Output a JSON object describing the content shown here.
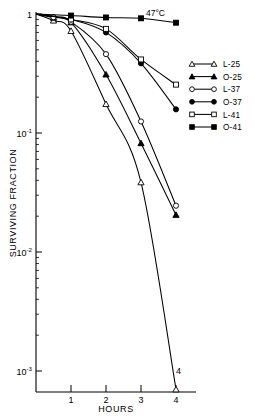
{
  "chart_data": {
    "type": "line",
    "title": "",
    "annotation": "47°C",
    "xlabel": "HOURS",
    "ylabel": "SURVIVING FRACTION",
    "xlim": [
      0,
      4.3
    ],
    "ylim": [
      0.0005,
      1
    ],
    "yscale": "log",
    "grid": false,
    "legend_position": "right",
    "x_ticks": [
      "1",
      "2",
      "3",
      "4"
    ],
    "x_tick_values": [
      1,
      2,
      3,
      4
    ],
    "y_ticks": [
      "1",
      "10-1",
      "10-2",
      "10-3"
    ],
    "y_tick_values": [
      1,
      0.1,
      0.01,
      0.001
    ],
    "y_tick_mantissa": [
      "1",
      "10",
      "10",
      "10"
    ],
    "y_tick_exponent": [
      "",
      "-1",
      "-2",
      "-3"
    ],
    "series": [
      {
        "name": "L-25",
        "marker": "open-triangle",
        "x": [
          0,
          0.5,
          1,
          2,
          3,
          4
        ],
        "y": [
          1.0,
          0.88,
          0.72,
          0.175,
          0.0385,
          0.0007
        ]
      },
      {
        "name": "O-25",
        "marker": "filled-triangle",
        "x": [
          0,
          0.5,
          1,
          2,
          3,
          4
        ],
        "y": [
          1.0,
          0.93,
          0.85,
          0.31,
          0.082,
          0.0205
        ]
      },
      {
        "name": "L-37",
        "marker": "open-circle",
        "x": [
          0,
          0.5,
          1,
          2,
          3,
          4
        ],
        "y": [
          1.0,
          0.94,
          0.86,
          0.46,
          0.125,
          0.0245
        ]
      },
      {
        "name": "O-37",
        "marker": "filled-circle",
        "x": [
          0,
          1,
          2,
          3,
          4
        ],
        "y": [
          1.0,
          0.9,
          0.7,
          0.385,
          0.158
        ]
      },
      {
        "name": "L-41",
        "marker": "open-square",
        "x": [
          0,
          1,
          2,
          3,
          4
        ],
        "y": [
          1.0,
          0.9,
          0.75,
          0.415,
          0.255
        ]
      },
      {
        "name": "O-41",
        "marker": "filled-square",
        "x": [
          0,
          1,
          2,
          3,
          4
        ],
        "y": [
          1.0,
          0.97,
          0.935,
          0.92,
          0.845
        ]
      }
    ]
  },
  "legend": {
    "entries": [
      {
        "label": "L-25",
        "marker": "open-triangle"
      },
      {
        "label": "O-25",
        "marker": "filled-triangle"
      },
      {
        "label": "L-37",
        "marker": "open-circle"
      },
      {
        "label": "O-37",
        "marker": "filled-circle"
      },
      {
        "label": "L-41",
        "marker": "open-square"
      },
      {
        "label": "O-41",
        "marker": "filled-square"
      }
    ]
  },
  "colors": {
    "ink": "#000000",
    "background": "#ffffff"
  }
}
